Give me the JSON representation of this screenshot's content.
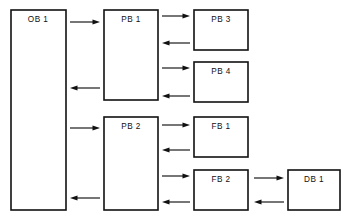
{
  "figure": {
    "kind": "block-call-structure-diagram",
    "width": 349,
    "height": 224,
    "background_color": "#ffffff",
    "line_color": "#111111",
    "caption": "",
    "caption_note": "partial caption line clipped at bottom edge, illegible"
  },
  "blocks": [
    {
      "id": "ob1",
      "label": "OB  1",
      "type": "OB",
      "number": "1",
      "x": 11,
      "y": 10,
      "w": 55,
      "h": 200,
      "label_x": 38,
      "label_y": 20
    },
    {
      "id": "pb1",
      "label": "PB  1",
      "type": "PB",
      "number": "1",
      "x": 104,
      "y": 10,
      "w": 54,
      "h": 90,
      "label_x": 131,
      "label_y": 20
    },
    {
      "id": "pb2",
      "label": "PB  2",
      "type": "PB",
      "number": "2",
      "x": 104,
      "y": 117,
      "w": 54,
      "h": 93,
      "label_x": 131,
      "label_y": 127
    },
    {
      "id": "pb3",
      "label": "PB  3",
      "type": "PB",
      "number": "3",
      "x": 194,
      "y": 10,
      "w": 54,
      "h": 40,
      "label_x": 221,
      "label_y": 20
    },
    {
      "id": "pb4",
      "label": "PB  4",
      "type": "PB",
      "number": "4",
      "x": 194,
      "y": 62,
      "w": 54,
      "h": 40,
      "label_x": 221,
      "label_y": 72
    },
    {
      "id": "fb1",
      "label": "FB  1",
      "type": "FB",
      "number": "1",
      "x": 194,
      "y": 117,
      "w": 54,
      "h": 40,
      "label_x": 221,
      "label_y": 127
    },
    {
      "id": "fb2",
      "label": "FB  2",
      "type": "FB",
      "number": "2",
      "x": 194,
      "y": 170,
      "w": 54,
      "h": 40,
      "label_x": 221,
      "label_y": 180
    },
    {
      "id": "db1",
      "label": "DB  1",
      "type": "DB",
      "number": "1",
      "x": 288,
      "y": 170,
      "w": 52,
      "h": 40,
      "label_x": 314,
      "label_y": 180
    }
  ],
  "connections": [
    {
      "id": "ob1-to-pb1",
      "from": "ob1",
      "to": "pb1",
      "direction": "right",
      "x1": 70,
      "x2": 100,
      "y": 22
    },
    {
      "id": "pb1-to-ob1",
      "from": "pb1",
      "to": "ob1",
      "direction": "left",
      "x1": 100,
      "x2": 70,
      "y": 88
    },
    {
      "id": "ob1-to-pb2",
      "from": "ob1",
      "to": "pb2",
      "direction": "right",
      "x1": 70,
      "x2": 100,
      "y": 128
    },
    {
      "id": "pb2-to-ob1",
      "from": "pb2",
      "to": "ob1",
      "direction": "left",
      "x1": 100,
      "x2": 70,
      "y": 198
    },
    {
      "id": "pb1-to-pb3",
      "from": "pb1",
      "to": "pb3",
      "direction": "right",
      "x1": 162,
      "x2": 190,
      "y": 16
    },
    {
      "id": "pb3-to-pb1",
      "from": "pb3",
      "to": "pb1",
      "direction": "left",
      "x1": 190,
      "x2": 162,
      "y": 43
    },
    {
      "id": "pb1-to-pb4",
      "from": "pb1",
      "to": "pb4",
      "direction": "right",
      "x1": 162,
      "x2": 190,
      "y": 68
    },
    {
      "id": "pb4-to-pb1",
      "from": "pb4",
      "to": "pb1",
      "direction": "left",
      "x1": 190,
      "x2": 162,
      "y": 96
    },
    {
      "id": "pb2-to-fb1",
      "from": "pb2",
      "to": "fb1",
      "direction": "right",
      "x1": 162,
      "x2": 190,
      "y": 125
    },
    {
      "id": "fb1-to-pb2",
      "from": "fb1",
      "to": "pb2",
      "direction": "left",
      "x1": 190,
      "x2": 162,
      "y": 150
    },
    {
      "id": "pb2-to-fb2",
      "from": "pb2",
      "to": "fb2",
      "direction": "right",
      "x1": 162,
      "x2": 190,
      "y": 176
    },
    {
      "id": "fb2-to-pb2",
      "from": "fb2",
      "to": "pb2",
      "direction": "left",
      "x1": 190,
      "x2": 162,
      "y": 202
    },
    {
      "id": "fb2-to-db1",
      "from": "fb2",
      "to": "db1",
      "direction": "right",
      "x1": 254,
      "x2": 284,
      "y": 178
    },
    {
      "id": "db1-to-fb2",
      "from": "db1",
      "to": "fb2",
      "direction": "left",
      "x1": 284,
      "x2": 254,
      "y": 202
    }
  ]
}
